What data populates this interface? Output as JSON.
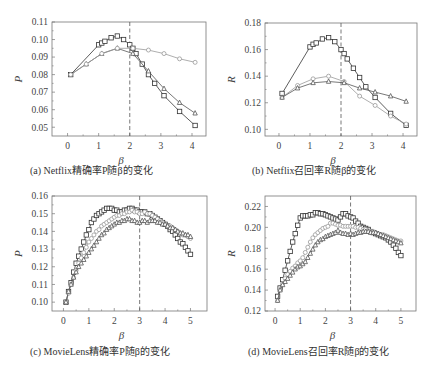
{
  "chart_data": [
    {
      "id": "a",
      "type": "line",
      "title": "",
      "caption": "(a) Netflix精确率P随β的变化",
      "xlabel": "β",
      "ylabel": "P",
      "xlim": [
        -0.5,
        4.45
      ],
      "ylim": [
        0.045,
        0.11
      ],
      "xticks": [
        0,
        1,
        2,
        3,
        4
      ],
      "yticks": [
        0.05,
        0.06,
        0.07,
        0.08,
        0.09,
        0.1,
        0.11
      ],
      "ytick_labels": [
        "0.05",
        "0.06",
        "0.07",
        "0.08",
        "0.09",
        "0.10",
        "0.11"
      ],
      "vline": 2,
      "grid": false,
      "series": [
        {
          "name": "series-squares",
          "marker": "square",
          "color": "#333333",
          "x": [
            0.1,
            1.0,
            1.1,
            1.2,
            1.4,
            1.6,
            1.8,
            2.0,
            2.1,
            2.2,
            2.4,
            2.6,
            2.8,
            3.1,
            3.6,
            4.1
          ],
          "y": [
            0.08,
            0.097,
            0.098,
            0.099,
            0.101,
            0.102,
            0.1,
            0.097,
            0.095,
            0.092,
            0.086,
            0.08,
            0.075,
            0.068,
            0.059,
            0.051
          ]
        },
        {
          "name": "series-triangles",
          "marker": "triangle",
          "color": "#555555",
          "x": [
            0.1,
            0.6,
            1.1,
            1.6,
            2.1,
            2.6,
            3.1,
            3.6,
            4.1
          ],
          "y": [
            0.08,
            0.086,
            0.092,
            0.095,
            0.092,
            0.082,
            0.072,
            0.064,
            0.058
          ]
        },
        {
          "name": "series-diamonds",
          "marker": "diamond",
          "color": "#999999",
          "x": [
            0.1,
            0.6,
            1.1,
            1.6,
            2.1,
            2.6,
            3.1,
            3.6,
            4.1
          ],
          "y": [
            0.08,
            0.086,
            0.092,
            0.095,
            0.095,
            0.094,
            0.092,
            0.089,
            0.087
          ]
        }
      ]
    },
    {
      "id": "b",
      "type": "line",
      "title": "",
      "caption": "(b) Netflix召回率R随β的变化",
      "xlabel": "β",
      "ylabel": "R",
      "xlim": [
        -0.45,
        4.45
      ],
      "ylim": [
        0.095,
        0.18
      ],
      "xticks": [
        0,
        1,
        2,
        3,
        4
      ],
      "yticks": [
        0.1,
        0.12,
        0.14,
        0.16,
        0.18
      ],
      "ytick_labels": [
        "0.10",
        "0.12",
        "0.14",
        "0.16",
        "0.18"
      ],
      "vline": 2,
      "grid": false,
      "series": [
        {
          "name": "series-squares",
          "marker": "square",
          "color": "#333333",
          "x": [
            0.1,
            1.0,
            1.1,
            1.2,
            1.4,
            1.6,
            1.8,
            2.0,
            2.1,
            2.2,
            2.4,
            2.6,
            2.8,
            3.1,
            3.6,
            4.1
          ],
          "y": [
            0.127,
            0.162,
            0.164,
            0.165,
            0.168,
            0.169,
            0.166,
            0.16,
            0.157,
            0.153,
            0.146,
            0.139,
            0.132,
            0.124,
            0.112,
            0.103
          ]
        },
        {
          "name": "series-diamonds",
          "marker": "diamond",
          "color": "#999999",
          "x": [
            0.1,
            0.6,
            1.1,
            1.6,
            2.1,
            2.6,
            3.1,
            3.6,
            4.1
          ],
          "y": [
            0.124,
            0.133,
            0.138,
            0.14,
            0.136,
            0.125,
            0.118,
            0.11,
            0.104
          ]
        },
        {
          "name": "series-triangles",
          "marker": "triangle",
          "color": "#555555",
          "x": [
            0.1,
            0.6,
            1.1,
            1.6,
            2.1,
            2.6,
            3.1,
            3.6,
            4.1
          ],
          "y": [
            0.124,
            0.131,
            0.135,
            0.136,
            0.135,
            0.131,
            0.128,
            0.125,
            0.121
          ]
        }
      ]
    },
    {
      "id": "c",
      "type": "line",
      "title": "",
      "caption": "(c) MovieLens精确率P随β的变化",
      "xlabel": "β",
      "ylabel": "P",
      "xlim": [
        -0.45,
        5.65
      ],
      "ylim": [
        0.095,
        0.16
      ],
      "xticks": [
        0,
        1,
        2,
        3,
        4,
        5
      ],
      "yticks": [
        0.1,
        0.11,
        0.12,
        0.13,
        0.14,
        0.15,
        0.16
      ],
      "ytick_labels": [
        "0.10",
        "0.11",
        "0.12",
        "0.13",
        "0.14",
        "0.15",
        "0.16"
      ],
      "vline": 3,
      "grid": false,
      "series": [
        {
          "name": "series-squares",
          "marker": "square",
          "color": "#333333",
          "x": [
            0.1,
            0.2,
            0.3,
            0.4,
            0.5,
            0.6,
            0.7,
            0.8,
            0.9,
            1.0,
            1.1,
            1.2,
            1.3,
            1.4,
            1.5,
            1.6,
            1.7,
            1.8,
            1.9,
            2.0,
            2.1,
            2.2,
            2.3,
            2.4,
            2.5,
            2.6,
            2.7,
            2.8,
            2.9,
            3.0,
            3.1,
            3.2,
            3.3,
            3.4,
            3.5,
            3.6,
            3.7,
            3.8,
            3.9,
            4.0,
            4.1,
            4.2,
            4.3,
            4.4,
            4.5,
            4.6,
            4.7,
            4.8,
            4.9,
            5.0
          ],
          "y": [
            0.1,
            0.106,
            0.111,
            0.117,
            0.122,
            0.126,
            0.13,
            0.134,
            0.138,
            0.141,
            0.145,
            0.147,
            0.149,
            0.15,
            0.151,
            0.152,
            0.153,
            0.153,
            0.153,
            0.152,
            0.152,
            0.151,
            0.151,
            0.152,
            0.152,
            0.153,
            0.153,
            0.152,
            0.152,
            0.151,
            0.151,
            0.151,
            0.15,
            0.15,
            0.149,
            0.148,
            0.147,
            0.146,
            0.145,
            0.144,
            0.143,
            0.141,
            0.14,
            0.138,
            0.136,
            0.134,
            0.133,
            0.131,
            0.129,
            0.127
          ]
        },
        {
          "name": "series-diamonds",
          "marker": "diamond",
          "color": "#999999",
          "x": [
            0.1,
            0.2,
            0.3,
            0.4,
            0.5,
            0.6,
            0.7,
            0.8,
            0.9,
            1.0,
            1.1,
            1.2,
            1.3,
            1.4,
            1.5,
            1.6,
            1.7,
            1.8,
            1.9,
            2.0,
            2.1,
            2.2,
            2.3,
            2.4,
            2.5,
            2.6,
            2.7,
            2.8,
            2.9,
            3.0,
            3.1,
            3.2,
            3.3,
            3.4,
            3.5,
            3.6,
            3.7,
            3.8,
            3.9,
            4.0,
            4.1,
            4.2,
            4.3,
            4.4,
            4.5,
            4.6,
            4.7,
            4.8,
            4.9,
            5.0
          ],
          "y": [
            0.1,
            0.105,
            0.11,
            0.114,
            0.118,
            0.122,
            0.125,
            0.128,
            0.131,
            0.134,
            0.136,
            0.138,
            0.14,
            0.141,
            0.143,
            0.144,
            0.145,
            0.146,
            0.147,
            0.148,
            0.149,
            0.149,
            0.15,
            0.15,
            0.151,
            0.151,
            0.152,
            0.151,
            0.151,
            0.15,
            0.15,
            0.151,
            0.15,
            0.15,
            0.149,
            0.148,
            0.147,
            0.146,
            0.145,
            0.144,
            0.143,
            0.143,
            0.142,
            0.141,
            0.14,
            0.139,
            0.138,
            0.138,
            0.137,
            0.136
          ]
        },
        {
          "name": "series-triangles",
          "marker": "triangle",
          "color": "#555555",
          "x": [
            0.1,
            0.2,
            0.3,
            0.4,
            0.5,
            0.6,
            0.7,
            0.8,
            0.9,
            1.0,
            1.1,
            1.2,
            1.3,
            1.4,
            1.5,
            1.6,
            1.7,
            1.8,
            1.9,
            2.0,
            2.1,
            2.2,
            2.3,
            2.4,
            2.5,
            2.6,
            2.7,
            2.8,
            2.9,
            3.0,
            3.1,
            3.2,
            3.3,
            3.4,
            3.5,
            3.6,
            3.7,
            3.8,
            3.9,
            4.0,
            4.1,
            4.2,
            4.3,
            4.4,
            4.5,
            4.6,
            4.7,
            4.8,
            4.9,
            5.0
          ],
          "y": [
            0.1,
            0.106,
            0.11,
            0.114,
            0.117,
            0.12,
            0.122,
            0.124,
            0.126,
            0.128,
            0.13,
            0.132,
            0.134,
            0.136,
            0.138,
            0.139,
            0.141,
            0.142,
            0.143,
            0.144,
            0.145,
            0.145,
            0.146,
            0.146,
            0.147,
            0.147,
            0.146,
            0.146,
            0.145,
            0.145,
            0.146,
            0.146,
            0.145,
            0.146,
            0.146,
            0.146,
            0.145,
            0.145,
            0.144,
            0.144,
            0.143,
            0.142,
            0.142,
            0.141,
            0.14,
            0.139,
            0.139,
            0.138,
            0.138,
            0.137
          ]
        }
      ]
    },
    {
      "id": "d",
      "type": "line",
      "title": "",
      "caption": "(d) MovieLens召回率R随β的变化",
      "xlabel": "β",
      "ylabel": "R",
      "xlim": [
        -0.4,
        5.6
      ],
      "ylim": [
        0.12,
        0.23
      ],
      "xticks": [
        0,
        1,
        2,
        3,
        4,
        5
      ],
      "yticks": [
        0.12,
        0.14,
        0.16,
        0.18,
        0.2,
        0.22
      ],
      "ytick_labels": [
        "0.12",
        "0.14",
        "0.16",
        "0.18",
        "0.20",
        "0.22"
      ],
      "vline": 3,
      "grid": false,
      "series": [
        {
          "name": "series-squares",
          "marker": "square",
          "color": "#333333",
          "x": [
            0.1,
            0.2,
            0.3,
            0.4,
            0.5,
            0.6,
            0.7,
            0.8,
            0.9,
            1.0,
            1.1,
            1.2,
            1.3,
            1.4,
            1.5,
            1.6,
            1.7,
            1.8,
            1.9,
            2.0,
            2.1,
            2.2,
            2.3,
            2.4,
            2.5,
            2.6,
            2.7,
            2.8,
            2.9,
            3.0,
            3.1,
            3.2,
            3.3,
            3.4,
            3.5,
            3.6,
            3.7,
            3.8,
            3.9,
            4.0,
            4.1,
            4.2,
            4.3,
            4.4,
            4.5,
            4.6,
            4.7,
            4.8,
            4.9,
            5.0
          ],
          "y": [
            0.134,
            0.142,
            0.15,
            0.159,
            0.168,
            0.177,
            0.186,
            0.194,
            0.202,
            0.209,
            0.211,
            0.211,
            0.211,
            0.212,
            0.212,
            0.214,
            0.214,
            0.213,
            0.213,
            0.212,
            0.211,
            0.21,
            0.209,
            0.208,
            0.207,
            0.21,
            0.213,
            0.213,
            0.211,
            0.21,
            0.209,
            0.206,
            0.204,
            0.201,
            0.2,
            0.199,
            0.198,
            0.196,
            0.195,
            0.194,
            0.193,
            0.192,
            0.191,
            0.19,
            0.188,
            0.186,
            0.183,
            0.18,
            0.176,
            0.173
          ]
        },
        {
          "name": "series-diamonds",
          "marker": "diamond",
          "color": "#999999",
          "x": [
            0.1,
            0.2,
            0.3,
            0.4,
            0.5,
            0.6,
            0.7,
            0.8,
            0.9,
            1.0,
            1.1,
            1.2,
            1.3,
            1.4,
            1.5,
            1.6,
            1.7,
            1.8,
            1.9,
            2.0,
            2.1,
            2.2,
            2.3,
            2.4,
            2.5,
            2.6,
            2.7,
            2.8,
            2.9,
            3.0,
            3.1,
            3.2,
            3.3,
            3.4,
            3.5,
            3.6,
            3.7,
            3.8,
            3.9,
            4.0,
            4.1,
            4.2,
            4.3,
            4.4,
            4.5,
            4.6,
            4.7,
            4.8,
            4.9,
            5.0
          ],
          "y": [
            0.13,
            0.14,
            0.146,
            0.151,
            0.155,
            0.158,
            0.161,
            0.163,
            0.166,
            0.168,
            0.171,
            0.176,
            0.181,
            0.186,
            0.19,
            0.193,
            0.195,
            0.197,
            0.199,
            0.2,
            0.201,
            0.204,
            0.204,
            0.203,
            0.202,
            0.202,
            0.201,
            0.201,
            0.201,
            0.201,
            0.201,
            0.2,
            0.2,
            0.199,
            0.198,
            0.198,
            0.197,
            0.196,
            0.196,
            0.195,
            0.194,
            0.193,
            0.193,
            0.192,
            0.191,
            0.19,
            0.189,
            0.188,
            0.187,
            0.187
          ]
        },
        {
          "name": "series-triangles",
          "marker": "triangle",
          "color": "#555555",
          "x": [
            0.1,
            0.2,
            0.3,
            0.4,
            0.5,
            0.6,
            0.7,
            0.8,
            0.9,
            1.0,
            1.1,
            1.2,
            1.3,
            1.4,
            1.5,
            1.6,
            1.7,
            1.8,
            1.9,
            2.0,
            2.1,
            2.2,
            2.3,
            2.4,
            2.5,
            2.6,
            2.7,
            2.8,
            2.9,
            3.0,
            3.1,
            3.2,
            3.3,
            3.4,
            3.5,
            3.6,
            3.7,
            3.8,
            3.9,
            4.0,
            4.1,
            4.2,
            4.3,
            4.4,
            4.5,
            4.6,
            4.7,
            4.8,
            4.9,
            5.0
          ],
          "y": [
            0.13,
            0.14,
            0.145,
            0.148,
            0.151,
            0.154,
            0.157,
            0.16,
            0.162,
            0.163,
            0.165,
            0.167,
            0.171,
            0.175,
            0.179,
            0.183,
            0.186,
            0.188,
            0.189,
            0.191,
            0.192,
            0.193,
            0.194,
            0.195,
            0.197,
            0.195,
            0.194,
            0.194,
            0.193,
            0.194,
            0.193,
            0.194,
            0.195,
            0.195,
            0.196,
            0.196,
            0.196,
            0.195,
            0.195,
            0.195,
            0.194,
            0.193,
            0.192,
            0.191,
            0.19,
            0.189,
            0.188,
            0.187,
            0.186,
            0.185
          ]
        }
      ]
    }
  ],
  "layout": {
    "panels": [
      {
        "left": 52,
        "top": 22,
        "width": 154,
        "height": 114,
        "caption_x": 30,
        "caption_y": 162
      },
      {
        "left": 265,
        "top": 23,
        "width": 152,
        "height": 113,
        "caption_x": 252,
        "caption_y": 162
      },
      {
        "left": 52,
        "top": 196,
        "width": 155,
        "height": 115,
        "caption_x": 30,
        "caption_y": 343
      },
      {
        "left": 265,
        "top": 196,
        "width": 151,
        "height": 115,
        "caption_x": 248,
        "caption_y": 343
      }
    ]
  }
}
